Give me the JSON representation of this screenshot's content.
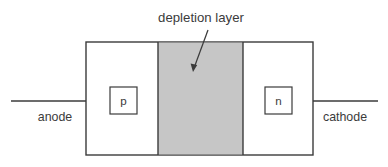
{
  "diagram": {
    "title": "depletion layer",
    "terminals": {
      "left_label": "anode",
      "right_label": "cathode"
    },
    "regions": {
      "p_label": "p",
      "n_label": "n"
    },
    "colors": {
      "depletion_fill": "#c6c6c6",
      "stroke": "#3b3b3b",
      "text": "#3b3b3b",
      "body_fill": "#ffffff",
      "background": "#ffffff"
    },
    "annotation": {
      "arrow_name": "depletion-layer-pointer",
      "arrow_from_x": 208,
      "arrow_from_y": 30,
      "arrow_to_x": 193,
      "arrow_to_y": 71
    },
    "geometry": {
      "body_x": 86,
      "body_y": 42,
      "body_width": 227,
      "body_height": 113,
      "depletion_x": 158,
      "depletion_width": 85,
      "lead_y": 101,
      "lead_left_x": 11,
      "lead_right_x": 378,
      "p_box_x": 110,
      "n_box_x": 265,
      "small_box_y": 87,
      "small_box_size": 27
    }
  }
}
